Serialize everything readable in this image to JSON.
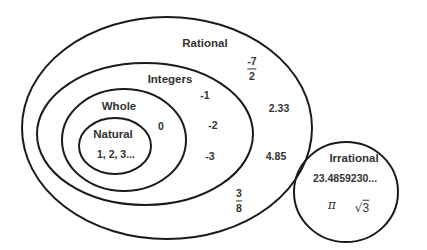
{
  "diagram": {
    "type": "venn-nested",
    "title": "",
    "sets": {
      "rational": {
        "label": "Rational",
        "examples": [
          "-7/2",
          "2.33",
          "4.85",
          "3/8"
        ]
      },
      "integers": {
        "label": "Integers",
        "examples": [
          "-1",
          "-2",
          "-3"
        ]
      },
      "whole": {
        "label": "Whole",
        "examples": [
          "0"
        ]
      },
      "natural": {
        "label": "Natural",
        "examples": [
          "1, 2, 3..."
        ]
      },
      "irrational": {
        "label": "Irrational",
        "examples": [
          "23.4859230...",
          "π",
          "√3"
        ]
      }
    },
    "fractions": {
      "neg_seven_halves": {
        "num": "-7",
        "den": "2"
      },
      "three_eighths": {
        "num": "3",
        "den": "8"
      }
    },
    "values": {
      "natural": "1, 2, 3...",
      "zero": "0",
      "neg1": "-1",
      "neg2": "-2",
      "neg3": "-3",
      "d233": "2.33",
      "d485": "4.85",
      "irr_decimal": "23.4859230...",
      "pi": "π",
      "sqrt3_symbol": "√",
      "sqrt3_value": "3"
    },
    "colors": {
      "stroke": "#1a1a1a",
      "text": "#333333",
      "background": "#ffffff"
    }
  }
}
